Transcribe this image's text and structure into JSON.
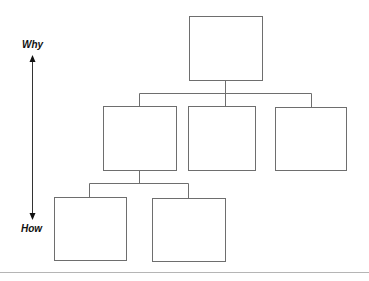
{
  "diagram": {
    "type": "hierarchy",
    "axis": {
      "top_label": "Why",
      "bottom_label": "How",
      "direction": "bidirectional-vertical"
    },
    "levels": [
      {
        "level": 1,
        "boxes": [
          {
            "id": "root",
            "text": ""
          }
        ]
      },
      {
        "level": 2,
        "boxes": [
          {
            "id": "child-1",
            "text": "",
            "parent": "root"
          },
          {
            "id": "child-2",
            "text": "",
            "parent": "root"
          },
          {
            "id": "child-3",
            "text": "",
            "parent": "root"
          }
        ]
      },
      {
        "level": 3,
        "boxes": [
          {
            "id": "grandchild-1",
            "text": "",
            "parent": "child-1"
          },
          {
            "id": "grandchild-2",
            "text": "",
            "parent": "child-1"
          }
        ]
      }
    ],
    "colors": {
      "line": "#6e6e6e",
      "text": "#111111",
      "divider": "#b5b5b5",
      "background": "#ffffff"
    }
  }
}
